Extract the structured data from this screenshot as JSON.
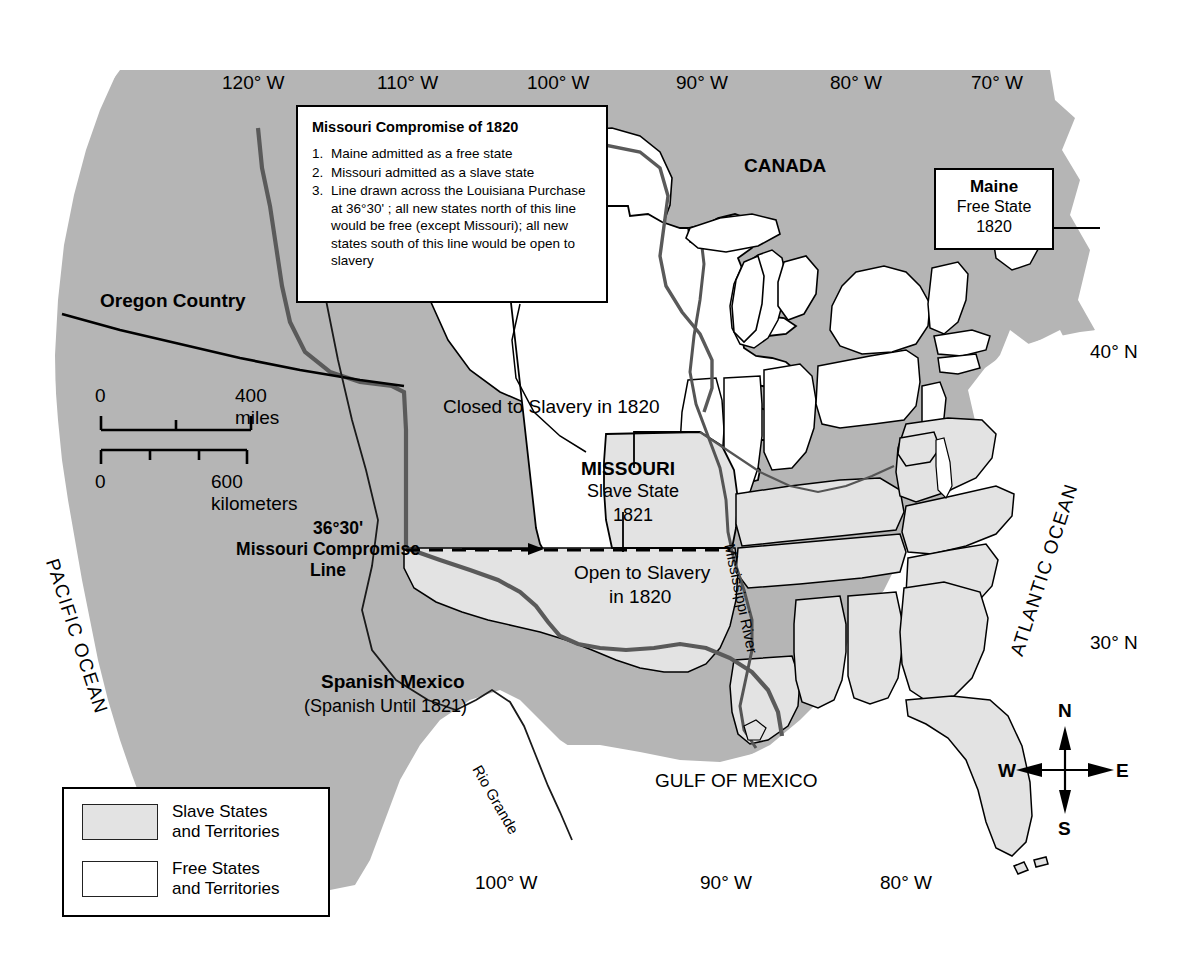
{
  "title": "The Missouri Compromise of 1820",
  "callouts": {
    "compromise": {
      "heading": "Missouri Compromise of 1820",
      "items": [
        {
          "num": "1.",
          "text": "Maine admitted as a free state"
        },
        {
          "num": "2.",
          "text": "Missouri admitted as a slave state"
        },
        {
          "num": "3.",
          "text": "Line drawn across the Louisiana Purchase at 36°30' ; all new states north of this line would be free (except Missouri); all new states south of this line would be open to slavery"
        }
      ]
    },
    "maine": {
      "name": "Maine",
      "status": "Free State",
      "year": "1820"
    }
  },
  "map_labels": {
    "canada": "CANADA",
    "oregon_country": "Oregon Country",
    "closed_to_slavery": "Closed to Slavery in 1820",
    "open_to_slavery_line1": "Open to Slavery",
    "open_to_slavery_line2": "in 1820",
    "missouri_name": "MISSOURI",
    "missouri_status": "Slave State",
    "missouri_year": "1821",
    "spanish_mexico": "Spanish Mexico",
    "spanish_until": "(Spanish Until 1821)",
    "compromise_line_deg": "36°30'",
    "compromise_line_name": "Missouri Compromise",
    "compromise_line_name2": "Line",
    "pacific_ocean": "PACIFIC OCEAN",
    "atlantic_ocean": "ATLANTIC OCEAN",
    "gulf_of_mexico": "GULF OF MEXICO",
    "mississippi_river": "Mississippi River",
    "rio_grande": "Rio Grande"
  },
  "graticule": {
    "top": [
      "120° W",
      "110° W",
      "100° W",
      "90° W",
      "80° W",
      "70° W"
    ],
    "bottom": [
      "100° W",
      "90° W",
      "80° W"
    ],
    "right": [
      "40° N",
      "30° N"
    ]
  },
  "scale": {
    "miles_zero": "0",
    "miles_max": "400 miles",
    "km_zero": "0",
    "km_max": "600 kilometers"
  },
  "legend": {
    "items": [
      {
        "swatch": "slave",
        "line1": "Slave States",
        "line2": "and Territories"
      },
      {
        "swatch": "free",
        "line1": "Free States",
        "line2": "and Territories"
      }
    ]
  },
  "compass": {
    "n": "N",
    "e": "E",
    "s": "S",
    "w": "W"
  },
  "colors": {
    "slave_fill": "#e3e3e3",
    "free_fill": "#ffffff",
    "territory_fill": "#b5b5b5",
    "outline": "#000000",
    "background": "#ffffff"
  }
}
